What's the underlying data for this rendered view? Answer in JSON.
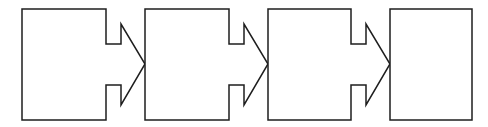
{
  "diagram": {
    "type": "process-flow",
    "stroke_color": "#1e1e1e",
    "fill_color": "#ffffff",
    "background": "#ffffff",
    "steps": [
      {
        "id": "step-1",
        "kind": "notched-arrow-box",
        "label": ""
      },
      {
        "id": "step-2",
        "kind": "notched-arrow-box",
        "label": ""
      },
      {
        "id": "step-3",
        "kind": "notched-arrow-box",
        "label": ""
      },
      {
        "id": "step-4",
        "kind": "box",
        "label": ""
      }
    ]
  }
}
